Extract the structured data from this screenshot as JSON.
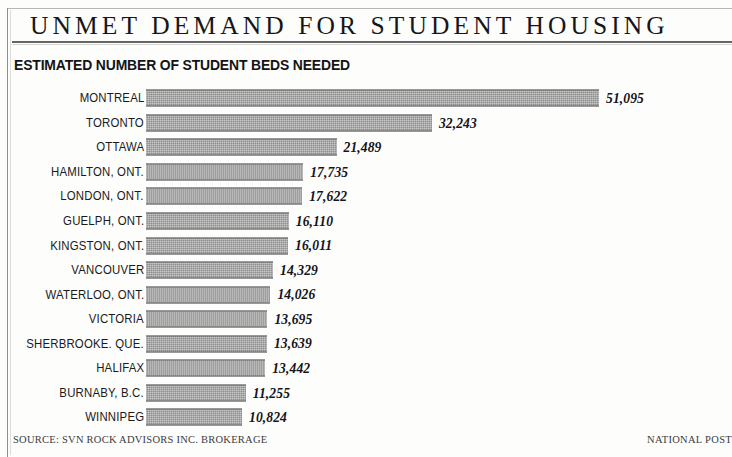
{
  "header": {
    "title": "UNMET DEMAND FOR STUDENT HOUSING",
    "subtitle": "ESTIMATED NUMBER OF STUDENT BEDS NEEDED"
  },
  "footer": {
    "source": "SOURCE: SVN ROCK ADVISORS INC. BROKERAGE",
    "credit": "NATIONAL POST"
  },
  "style": {
    "bar_color": "#8d8d8d",
    "bar_border_color": "#6f6f6f",
    "text_color": "#141414",
    "rule_color": "#66666a",
    "background": "#fdfdfc"
  },
  "chart_data": {
    "type": "bar",
    "orientation": "horizontal",
    "title": "UNMET DEMAND FOR STUDENT HOUSING",
    "subtitle": "ESTIMATED NUMBER OF STUDENT BEDS NEEDED",
    "xlabel": "",
    "ylabel": "",
    "grid": false,
    "legend": false,
    "xlim": [
      0,
      51095
    ],
    "value_format": "comma-separated integer, displayed in bold italic serif",
    "sort": "descending",
    "categories": [
      "MONTREAL",
      "TORONTO",
      "OTTAWA",
      "HAMILTON, ONT.",
      "LONDON, ONT.",
      "GUELPH, ONT.",
      "KINGSTON, ONT.",
      "VANCOUVER",
      "WATERLOO, ONT.",
      "VICTORIA",
      "SHERBROOKE. QUE.",
      "HALIFAX",
      "BURNABY, B.C.",
      "WINNIPEG"
    ],
    "values": [
      51095,
      32243,
      21489,
      17735,
      17622,
      16110,
      16011,
      14329,
      14026,
      13695,
      13639,
      13442,
      11255,
      10824
    ],
    "value_labels": [
      "51,095",
      "32,243",
      "21,489",
      "17,735",
      "17,622",
      "16,110",
      "16,011",
      "14,329",
      "14,026",
      "13,695",
      "13,639",
      "13,442",
      "11,255",
      "10,824"
    ]
  }
}
